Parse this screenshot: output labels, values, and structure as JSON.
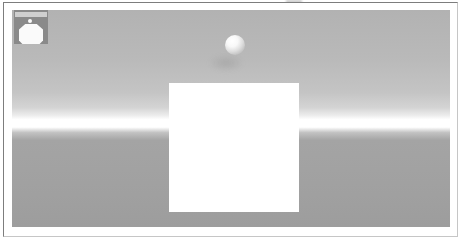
{
  "window": {
    "type": "rendered-3d-viewport-screenshot",
    "visible_text": ""
  },
  "colors": {
    "page_bg": "#ffffff",
    "border_dark": "#7d7d7d",
    "border_light": "#c6c6c6",
    "sky_top": "#b2b2b2",
    "horizon": "#ffffff",
    "ground": "#a4a4a4",
    "ground_bottom": "#9d9d9d",
    "sphere_hi": "#ffffff",
    "sphere_lo": "#a6a6a6",
    "cube": "#ffffff",
    "icon_bg": "#8a8a8a",
    "icon_bar": "#cfcfcf",
    "icon_glyph": "#fafafa"
  },
  "scene": {
    "description": "Gray gradient sky brightening to a white horizon band with flat gray ground below",
    "objects": {
      "sphere": {
        "shape": "sphere",
        "shading": "matte, lit from upper-left",
        "approx_center_x": 235,
        "approx_center_y": 45,
        "approx_diameter": 20
      },
      "cube": {
        "shape": "white square face",
        "approx_left": 169,
        "approx_top": 83,
        "approx_width": 130,
        "approx_height": 129
      }
    },
    "overlay_icon": {
      "description": "small dark square icon with light title bar, white dot and white octagonal glyph",
      "approx_left": 14,
      "approx_top": 10,
      "approx_size": 34
    }
  }
}
